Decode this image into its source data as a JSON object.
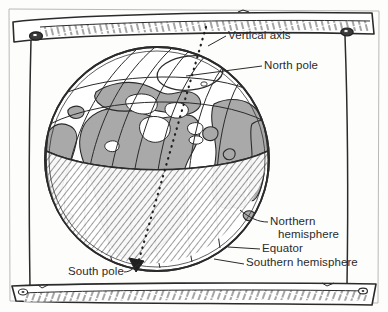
{
  "figure": {
    "style": "hand-drawn line illustration"
  },
  "colors": {
    "ink": "#2b2b2b",
    "land_fill": "#a9a9a9",
    "ocean_fill": "#ffffff",
    "hatch_ink": "#3a3a3a",
    "paper": "#fdfdfc",
    "frame_fill": "#ffffff"
  },
  "labels": [
    {
      "id": "vertical-axis",
      "text": "Vertical axis",
      "x": 228,
      "y": 30,
      "align": "left",
      "leader_from": [
        226,
        36
      ],
      "leader_to": [
        205,
        52
      ]
    },
    {
      "id": "north-pole",
      "text": "North pole",
      "x": 264,
      "y": 60,
      "align": "left",
      "leader_from": [
        262,
        66
      ],
      "leader_to": [
        186,
        76
      ]
    },
    {
      "id": "northern-hemisphere",
      "text": "Northern hemisphere",
      "line1": "Northern",
      "line2": "hemisphere",
      "x": 270,
      "y": 216,
      "align": "left",
      "leader_from": [
        268,
        222
      ],
      "leader_to": [
        240,
        222
      ]
    },
    {
      "id": "equator",
      "text": "Equator",
      "x": 262,
      "y": 243,
      "align": "left",
      "leader_from": [
        260,
        249
      ],
      "leader_to": [
        232,
        249
      ]
    },
    {
      "id": "southern-hemisphere",
      "text": "Southern hemisphere",
      "x": 246,
      "y": 258,
      "align": "left",
      "leader_from": [
        244,
        264
      ],
      "leader_to": [
        216,
        262
      ]
    },
    {
      "id": "south-pole",
      "text": "South pole",
      "x": 68,
      "y": 266,
      "align": "left",
      "leader_from": [
        124,
        272
      ],
      "leader_to": [
        140,
        266
      ]
    }
  ],
  "globe": {
    "center_x": 157,
    "center_y": 159,
    "radius": 112,
    "equator_label": "Equator",
    "meridian_count": 7,
    "axis_style": "dotted",
    "axis_top": [
      205,
      28
    ],
    "axis_bottom": [
      135,
      274
    ],
    "north_pole_point": [
      192,
      78
    ],
    "south_pole_point": [
      136,
      270
    ]
  },
  "frame": {
    "top_beam_label": "top-beam",
    "bottom_beam_label": "bottom-beam",
    "bolt_count": 4,
    "hatched": true
  }
}
